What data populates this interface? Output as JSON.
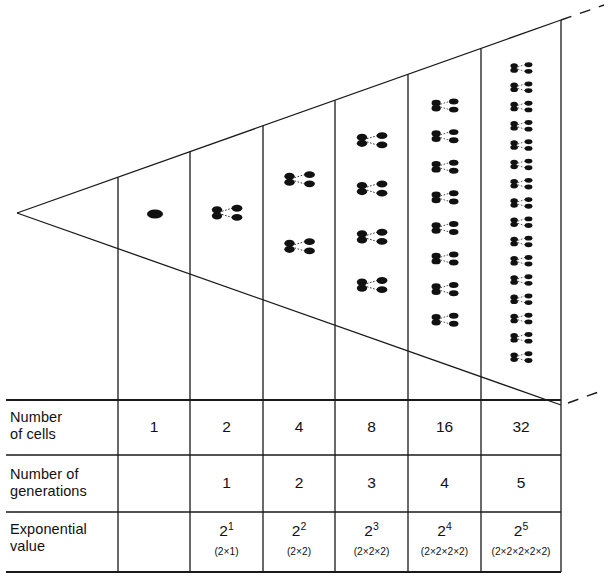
{
  "figure": {
    "line_color": "#1a1a1a",
    "cell_color": "#111111",
    "background": "#ffffff"
  },
  "diagram": {
    "apex": {
      "x": 17,
      "y": 213
    },
    "upper_end": {
      "x": 561,
      "y": 20
    },
    "lower_end": {
      "x": 561,
      "y": 405
    },
    "dashed_upper": {
      "x1": 561,
      "y1": 20,
      "x2": 604,
      "y2": 5
    },
    "dashed_lower": {
      "x1": 568,
      "y1": 403,
      "x2": 604,
      "y2": 390
    },
    "column_lines": [
      118,
      190,
      263,
      335,
      408,
      481,
      561
    ],
    "columns": [
      {
        "index": 1,
        "x0": 118,
        "x1": 190,
        "cells": 1,
        "clusters": 0,
        "single_cell": true
      },
      {
        "index": 2,
        "x0": 190,
        "x1": 263,
        "cells": 2,
        "clusters": 1,
        "single_cell": false
      },
      {
        "index": 3,
        "x0": 263,
        "x1": 335,
        "cells": 4,
        "clusters": 2,
        "single_cell": false
      },
      {
        "index": 4,
        "x0": 335,
        "x1": 408,
        "cells": 8,
        "clusters": 4,
        "single_cell": false
      },
      {
        "index": 5,
        "x0": 408,
        "x1": 481,
        "cells": 16,
        "clusters": 8,
        "single_cell": false
      },
      {
        "index": 6,
        "x0": 481,
        "x1": 561,
        "cells": 32,
        "clusters": 16,
        "single_cell": false
      }
    ]
  },
  "table": {
    "rows": [
      {
        "id": "number-of-cells",
        "label_line1": "Number",
        "label_line2": "of cells",
        "values": [
          "1",
          "2",
          "4",
          "8",
          "16",
          "32"
        ]
      },
      {
        "id": "number-of-generations",
        "label_line1": "Number of",
        "label_line2": "generations",
        "values": [
          "",
          "1",
          "2",
          "3",
          "4",
          "5"
        ]
      },
      {
        "id": "exponential-value",
        "label_line1": "Exponential",
        "label_line2": "value",
        "values": [
          "",
          "2",
          "2",
          "2",
          "2",
          "2"
        ],
        "exponents": [
          "",
          "1",
          "2",
          "3",
          "4",
          "5"
        ],
        "expansions": [
          "",
          "(2×1)",
          "(2×2)",
          "(2×2×2)",
          "(2×2×2×2)",
          "(2×2×2×2×2)"
        ]
      }
    ],
    "row_lines_y": [
      400,
      455,
      512,
      572
    ],
    "label_col_right": 118,
    "table_left": 6,
    "table_right": 561
  }
}
